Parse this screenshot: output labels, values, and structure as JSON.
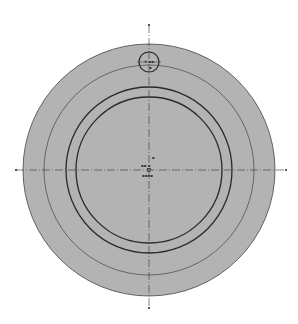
{
  "drawing": {
    "background": "#ffffff",
    "fill_color": "#b3b3b3",
    "line_color": "#2a2a2a",
    "center": {
      "x": 149,
      "y": 170
    },
    "outer_circle": {
      "r": 126
    },
    "thin_circle": {
      "r": 105
    },
    "thick_circle_outer": {
      "r": 83
    },
    "thick_circle_inner": {
      "r": 73
    },
    "small_circle": {
      "cx": 149,
      "cy": 62,
      "r": 10
    },
    "h_axis": {
      "x1": 16,
      "x2": 286
    },
    "v_axis": {
      "y1": 25,
      "y2": 308
    },
    "labels": {
      "small_circle_top": "⊕ ▪▪",
      "small_circle_bottom": "▪",
      "center_top": "▪",
      "center_left": "▪▪ ▪",
      "center_bottom": "▪▪▪▪"
    }
  }
}
